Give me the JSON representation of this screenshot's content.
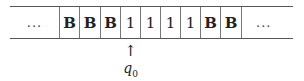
{
  "diagram": {
    "type": "turing-machine-tape",
    "tape": {
      "cells": [
        {
          "symbol": "...",
          "kind": "ellipsis"
        },
        {
          "symbol": "B",
          "kind": "blank"
        },
        {
          "symbol": "B",
          "kind": "blank"
        },
        {
          "symbol": "B",
          "kind": "blank"
        },
        {
          "symbol": "1",
          "kind": "digit"
        },
        {
          "symbol": "1",
          "kind": "digit"
        },
        {
          "symbol": "1",
          "kind": "digit"
        },
        {
          "symbol": "1",
          "kind": "digit"
        },
        {
          "symbol": "B",
          "kind": "blank"
        },
        {
          "symbol": "B",
          "kind": "blank"
        },
        {
          "symbol": "...",
          "kind": "ellipsis"
        }
      ]
    },
    "head": {
      "arrow": "↑",
      "state": "q",
      "state_subscript": "0",
      "position_index": 4
    }
  }
}
